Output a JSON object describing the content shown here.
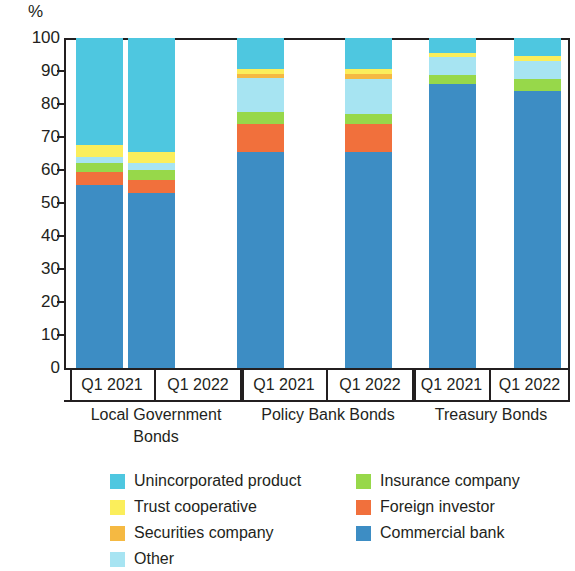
{
  "chart": {
    "type": "bar",
    "y_unit": "%",
    "y_ticks": [
      "100",
      "90",
      "80",
      "70",
      "60",
      "50",
      "40",
      "30",
      "20",
      "10",
      "0"
    ]
  },
  "groups": [
    {
      "name": "Local Government Bonds",
      "periods": [
        "Q1 2021",
        "Q1 2022"
      ]
    },
    {
      "name": "Policy Bank Bonds",
      "periods": [
        "Q1 2021",
        "Q1 2022"
      ]
    },
    {
      "name": "Treasury Bonds",
      "periods": [
        "Q1 2021",
        "Q1 2022"
      ]
    }
  ],
  "legend": {
    "left": [
      {
        "label": "Unincorporated product",
        "color": "#4ec7e0"
      },
      {
        "label": "Trust cooperative",
        "color": "#fbee5b"
      },
      {
        "label": "Securities company",
        "color": "#f5b942"
      },
      {
        "label": "Other",
        "color": "#a7e4f2"
      }
    ],
    "right": [
      {
        "label": "Insurance company",
        "color": "#97d84a"
      },
      {
        "label": "Foreign investor",
        "color": "#f1703c"
      },
      {
        "label": "Commercial bank",
        "color": "#3d8dc4"
      }
    ]
  },
  "chart_data": {
    "type": "bar",
    "stacked": true,
    "title": "",
    "xlabel": "",
    "ylabel": "%",
    "ylim": [
      0,
      100
    ],
    "grid": false,
    "legend_position": "bottom",
    "categories": [
      "Local Government Bonds Q1 2021",
      "Local Government Bonds Q1 2022",
      "Policy Bank Bonds Q1 2021",
      "Policy Bank Bonds Q1 2022",
      "Treasury Bonds Q1 2021",
      "Treasury Bonds Q1 2022"
    ],
    "series": [
      {
        "name": "Commercial bank",
        "color": "#3d8dc4",
        "values": [
          55.5,
          53.0,
          65.5,
          65.5,
          86.0,
          84.0
        ]
      },
      {
        "name": "Foreign investor",
        "color": "#f1703c",
        "values": [
          4.0,
          4.0,
          8.5,
          8.5,
          0.0,
          0.0
        ]
      },
      {
        "name": "Insurance company",
        "color": "#97d84a",
        "values": [
          2.5,
          3.0,
          3.5,
          3.0,
          2.8,
          3.5
        ]
      },
      {
        "name": "Other",
        "color": "#a7e4f2",
        "values": [
          2.0,
          2.0,
          10.5,
          10.5,
          5.5,
          5.5
        ]
      },
      {
        "name": "Securities company",
        "color": "#f5b942",
        "values": [
          0.0,
          0.0,
          1.2,
          1.5,
          0.0,
          0.0
        ]
      },
      {
        "name": "Trust cooperative",
        "color": "#fbee5b",
        "values": [
          3.5,
          3.5,
          1.5,
          1.5,
          1.2,
          1.5
        ]
      },
      {
        "name": "Unincorporated product",
        "color": "#4ec7e0",
        "values": [
          32.5,
          34.5,
          9.3,
          9.5,
          4.5,
          5.5
        ]
      }
    ]
  }
}
